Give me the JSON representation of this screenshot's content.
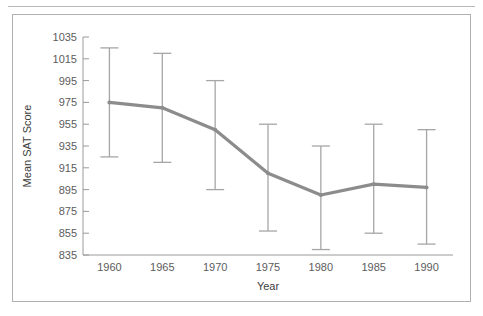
{
  "figure": {
    "frame_border_color": "#b0b0b0",
    "background_color": "#ffffff"
  },
  "chart_data": {
    "type": "line",
    "title": "",
    "subtitle": "",
    "xlabel": "Year",
    "ylabel": "Mean SAT Score",
    "x": [
      1960,
      1965,
      1970,
      1975,
      1980,
      1985,
      1990
    ],
    "categories": [
      "1960",
      "1965",
      "1970",
      "1975",
      "1980",
      "1985",
      "1990"
    ],
    "values": [
      975,
      970,
      950,
      910,
      890,
      900,
      897
    ],
    "error_upper": [
      1025,
      1020,
      995,
      955,
      935,
      955,
      950
    ],
    "error_lower": [
      925,
      920,
      895,
      857,
      840,
      855,
      845
    ],
    "series": [
      {
        "name": "Mean SAT Score",
        "values": [
          975,
          970,
          950,
          910,
          890,
          900,
          897
        ],
        "error_upper": [
          1025,
          1020,
          995,
          955,
          935,
          955,
          950
        ],
        "error_lower": [
          925,
          920,
          895,
          857,
          840,
          855,
          845
        ],
        "line_color": "#8c8c8c",
        "errorbar_color": "#a6a6a6"
      }
    ],
    "ylim": [
      835,
      1035
    ],
    "yticks": [
      835,
      855,
      875,
      895,
      915,
      935,
      955,
      975,
      995,
      1015,
      1035
    ],
    "ytick_labels": [
      "835",
      "855",
      "875",
      "895",
      "915",
      "935",
      "955",
      "975",
      "995",
      "1015",
      "1035"
    ],
    "xlim": [
      1957.5,
      1992.5
    ],
    "xticks": [
      1960,
      1965,
      1970,
      1975,
      1980,
      1985,
      1990
    ],
    "xtick_labels": [
      "1960",
      "1965",
      "1970",
      "1975",
      "1980",
      "1985",
      "1990"
    ],
    "grid": false,
    "legend": null,
    "legend_position": "none",
    "annotations": []
  }
}
